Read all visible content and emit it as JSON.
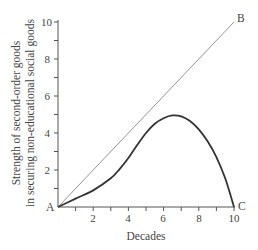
{
  "chart_data": {
    "type": "line",
    "title": "",
    "xlabel": "Decades",
    "ylabel_lines": [
      "Strength of second-order goods",
      "in securing non-educational social goods"
    ],
    "xlim": [
      0,
      10
    ],
    "ylim": [
      0,
      10
    ],
    "x_ticks": [
      2,
      4,
      6,
      8,
      10
    ],
    "y_ticks": [
      2,
      4,
      6,
      8,
      10
    ],
    "minor_ticks_every": 1,
    "grid": false,
    "legend": null,
    "series": [
      {
        "name": "A-B reference line",
        "style": "thin",
        "x": [
          0,
          10
        ],
        "y": [
          0,
          10
        ]
      },
      {
        "name": "A-C curve",
        "style": "thick",
        "x": [
          0,
          1,
          2,
          3,
          3.5,
          4,
          4.5,
          5,
          5.5,
          6,
          6.5,
          7,
          7.5,
          8,
          8.5,
          9,
          9.5,
          10
        ],
        "y": [
          0,
          0.45,
          0.9,
          1.55,
          2.05,
          2.65,
          3.35,
          4.0,
          4.5,
          4.8,
          4.95,
          4.9,
          4.65,
          4.2,
          3.55,
          2.7,
          1.55,
          0
        ]
      }
    ],
    "annotations": [
      {
        "text": "A",
        "x": 0,
        "y": 0
      },
      {
        "text": "B",
        "x": 10,
        "y": 10
      },
      {
        "text": "C",
        "x": 10,
        "y": 0
      }
    ]
  },
  "labels": {
    "x_axis_title": "Decades",
    "y_axis_title_line1": "Strength of second-order goods",
    "y_axis_title_line2": "in securing non-educational social goods",
    "point_a": "A",
    "point_b": "B",
    "point_c": "C",
    "x_tick_2": "2",
    "x_tick_4": "4",
    "x_tick_6": "6",
    "x_tick_8": "8",
    "x_tick_10": "10",
    "y_tick_2": "2",
    "y_tick_4": "4",
    "y_tick_6": "6",
    "y_tick_8": "8",
    "y_tick_10": "10"
  },
  "colors": {
    "axis": "#555555",
    "reference_line": "#777777",
    "curve": "#333333",
    "text": "#444444"
  }
}
